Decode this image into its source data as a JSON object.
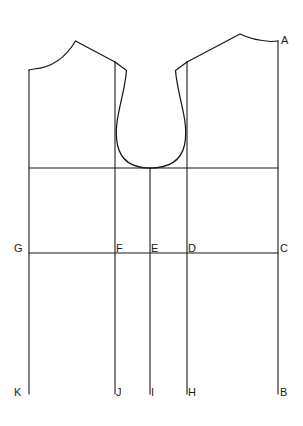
{
  "diagram": {
    "type": "technical-pattern-drafting-diagram",
    "background_color": "#ffffff",
    "line_color": "#1a1a1a",
    "canvas": {
      "width": 303,
      "height": 426
    },
    "point_labels": [
      {
        "id": "A",
        "text": "A",
        "x": 281,
        "y": 44
      },
      {
        "id": "G",
        "text": "G",
        "x": 14,
        "y": 252
      },
      {
        "id": "F",
        "text": "F",
        "x": 116,
        "y": 252
      },
      {
        "id": "E",
        "text": "E",
        "x": 151,
        "y": 252
      },
      {
        "id": "D",
        "text": "D",
        "x": 188,
        "y": 252
      },
      {
        "id": "C",
        "text": "C",
        "x": 280,
        "y": 252
      },
      {
        "id": "K",
        "text": "K",
        "x": 14,
        "y": 396
      },
      {
        "id": "J",
        "text": "J",
        "x": 116,
        "y": 396
      },
      {
        "id": "I",
        "text": "I",
        "x": 151,
        "y": 396
      },
      {
        "id": "H",
        "text": "H",
        "x": 188,
        "y": 396
      },
      {
        "id": "B",
        "text": "B",
        "x": 280,
        "y": 396
      }
    ],
    "construction_lines": {
      "vertical_left_edge": {
        "x": 29,
        "y1": 70,
        "y2": 394
      },
      "vertical_f": {
        "x": 115,
        "y1": 62,
        "y2": 394
      },
      "vertical_e": {
        "x": 150,
        "y1": 168,
        "y2": 394
      },
      "vertical_d": {
        "x": 187,
        "y1": 62,
        "y2": 394
      },
      "vertical_right_edge": {
        "x": 278,
        "y1": 41,
        "y2": 394
      },
      "horizontal_chest": {
        "y": 168,
        "x1": 29,
        "x2": 278
      },
      "horizontal_waist": {
        "y": 253,
        "x1": 29,
        "x2": 278
      }
    },
    "outline_segments": {
      "left_neck_shoulder": "M29,70 L33,69 C52,68 66,58 75,41 L115,62",
      "left_armhole": "M115,62 L126,70 C124,96 112,120 117,145 C121,161 133,168 150,168",
      "right_neck_shoulder": "M278,41 L272,41 C257,40 248,38 240,34 L187,62",
      "right_armhole": "M187,62 L176,70 C178,96 190,120 185,145 C181,161 168,168 150,168"
    }
  }
}
